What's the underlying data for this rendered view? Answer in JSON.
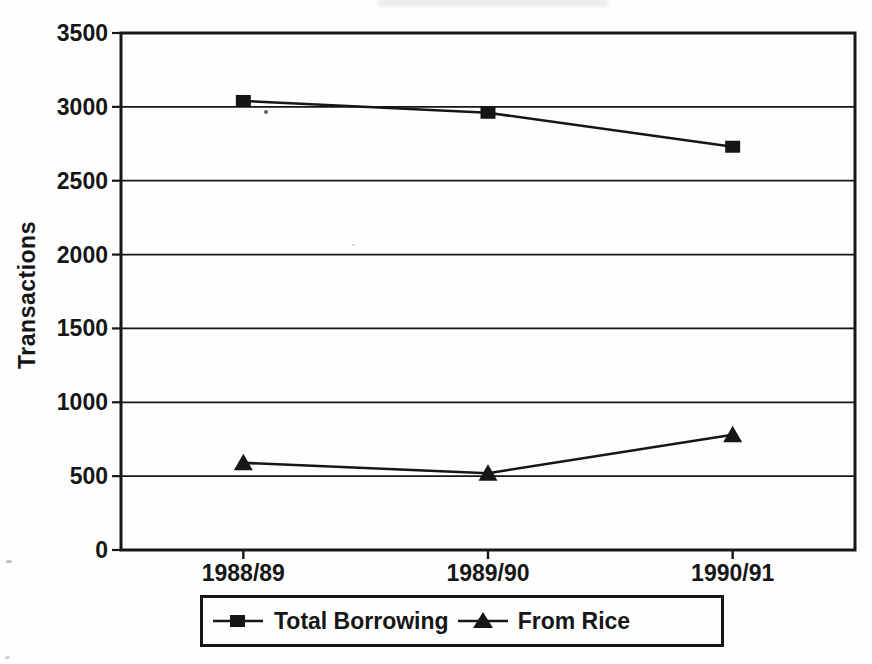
{
  "colors": {
    "ink": "#161616",
    "paper": "#fefefe"
  },
  "chart_data": {
    "type": "line",
    "title": "",
    "xlabel": "",
    "ylabel": "Transactions",
    "categories": [
      "1988/89",
      "1989/90",
      "1990/91"
    ],
    "series": [
      {
        "name": "Total Borrowing",
        "marker": "square",
        "values": [
          3040,
          2960,
          2730
        ]
      },
      {
        "name": "From Rice",
        "marker": "triangle",
        "values": [
          590,
          520,
          780
        ]
      }
    ],
    "ylim": [
      0,
      3500
    ],
    "ytick_step": 500,
    "yticks": [
      0,
      500,
      1000,
      1500,
      2000,
      2500,
      3000,
      3500
    ],
    "grid": true,
    "legend_position": "bottom"
  },
  "legend": {
    "entries": [
      {
        "label": "Total Borrowing",
        "marker_icon": "square-marker-icon"
      },
      {
        "label": "From Rice",
        "marker_icon": "triangle-marker-icon"
      }
    ]
  }
}
